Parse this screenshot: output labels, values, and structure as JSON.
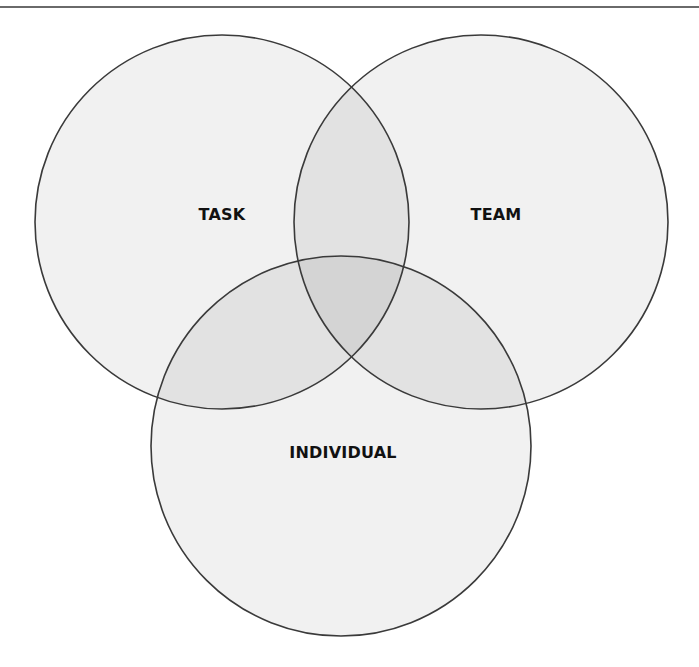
{
  "diagram": {
    "type": "venn",
    "sets": [
      {
        "id": "task",
        "label": "TASK",
        "cx": 222,
        "cy": 222,
        "r": 187,
        "label_x": 222,
        "label_y": 214
      },
      {
        "id": "team",
        "label": "TEAM",
        "cx": 481,
        "cy": 222,
        "r": 187,
        "label_x": 496,
        "label_y": 214
      },
      {
        "id": "individual",
        "label": "INDIVIDUAL",
        "cx": 341,
        "cy": 446,
        "r": 190,
        "label_x": 343,
        "label_y": 452
      }
    ],
    "colors": {
      "single_fill": "#f1f1f1",
      "double_overlap_fill": "#e2e2e2",
      "triple_overlap_fill": "#d4d4d4",
      "stroke": "#3a3a3a",
      "header_rule": "#6a6a6a"
    }
  }
}
